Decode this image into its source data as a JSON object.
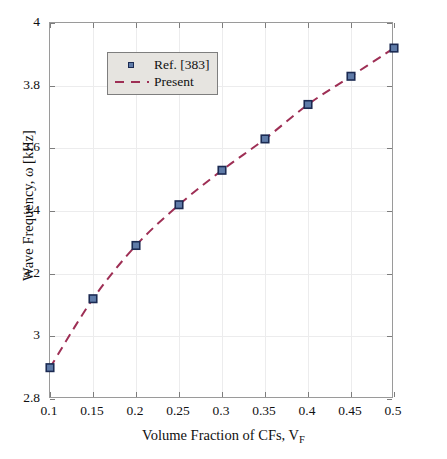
{
  "chart_data": {
    "type": "scatter",
    "title": "",
    "xlabel": "Volume Fraction of CFs, V_F",
    "xlabel_main": "Volume Fraction of CFs, V",
    "xlabel_sub": "F",
    "ylabel": "Wave Frequency, ω [kHz]",
    "xlim": [
      0.1,
      0.5
    ],
    "ylim": [
      2.8,
      4
    ],
    "xticks": [
      "0.1",
      "0.15",
      "0.2",
      "0.25",
      "0.3",
      "0.35",
      "0.4",
      "0.45",
      "0.5"
    ],
    "xtick_values": [
      0.1,
      0.15,
      0.2,
      0.25,
      0.3,
      0.35,
      0.4,
      0.45,
      0.5
    ],
    "yticks": [
      "2.8",
      "3",
      "3.2",
      "3.4",
      "3.6",
      "3.8",
      "4"
    ],
    "ytick_values": [
      2.8,
      3.0,
      3.2,
      3.4,
      3.6,
      3.8,
      4.0
    ],
    "grid": true,
    "legend_position": "upper left",
    "x": [
      0.1,
      0.15,
      0.2,
      0.25,
      0.3,
      0.35,
      0.4,
      0.45,
      0.5
    ],
    "series": [
      {
        "name": "Ref. [383]",
        "style": "markers",
        "marker": "square",
        "marker_color": "#5f7ba8",
        "marker_edge_color": "#1b2a52",
        "values": [
          2.9,
          3.12,
          3.29,
          3.42,
          3.53,
          3.63,
          3.74,
          3.83,
          3.92
        ]
      },
      {
        "name": "Present",
        "style": "dashed-line",
        "line_color": "#9e2f55",
        "values": [
          2.9,
          3.12,
          3.29,
          3.42,
          3.53,
          3.63,
          3.74,
          3.83,
          3.92
        ]
      }
    ]
  },
  "legend": {
    "items": [
      {
        "label": "Ref. [383]",
        "key": "square-marker"
      },
      {
        "label": "Present",
        "key": "dashed-line"
      }
    ]
  },
  "colors": {
    "marker_fill": "#5f7ba8",
    "marker_edge": "#1b2a52",
    "line": "#9e2f55",
    "axis": "#9a9a9a",
    "grid": "#ececed",
    "legend_bg": "#e6e4e0"
  }
}
